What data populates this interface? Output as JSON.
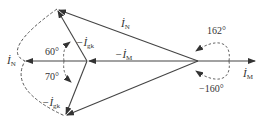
{
  "diagram": {
    "type": "phasor-diagram",
    "colors": {
      "stroke": "#444444",
      "text": "#333333",
      "background": "#ffffff"
    },
    "vectors": [
      {
        "id": "iN_top",
        "label": "İ_N",
        "from": [
          198,
          61
        ],
        "to": [
          57,
          9
        ]
      },
      {
        "id": "iN_bottom",
        "label": "",
        "from": [
          198,
          61
        ],
        "to": [
          65,
          116
        ]
      },
      {
        "id": "neg_iM",
        "label": "−İ_M",
        "from": [
          198,
          61
        ],
        "to": [
          87,
          61
        ]
      },
      {
        "id": "neg_igk_top",
        "label": "−İ_gk",
        "from": [
          87,
          61
        ],
        "to": [
          57,
          9
        ]
      },
      {
        "id": "neg_igk_bottom",
        "label": "−İ_gk",
        "from": [
          87,
          61
        ],
        "to": [
          65,
          116
        ]
      },
      {
        "id": "iN_left",
        "label": "İ_N",
        "from": [
          87,
          61
        ],
        "to": [
          25,
          61
        ]
      },
      {
        "id": "iM",
        "label": "İ_M",
        "from": [
          198,
          61
        ],
        "to": [
          255,
          61
        ]
      }
    ],
    "labels": {
      "iN_top": {
        "main": "İ",
        "sub": "N"
      },
      "neg_iM": {
        "main": "−İ",
        "sub": "M"
      },
      "neg_igk_top": {
        "main": "−İ",
        "sub": "gk"
      },
      "neg_igk_bottom": {
        "main": "−İ",
        "sub": "gk"
      },
      "iN_left": {
        "main": "İ",
        "sub": "N"
      },
      "iM": {
        "main": "İ",
        "sub": "M"
      }
    },
    "angles": {
      "a60": "60°",
      "a70": "70°",
      "a162": "162°",
      "a_neg160": "−160°"
    }
  }
}
